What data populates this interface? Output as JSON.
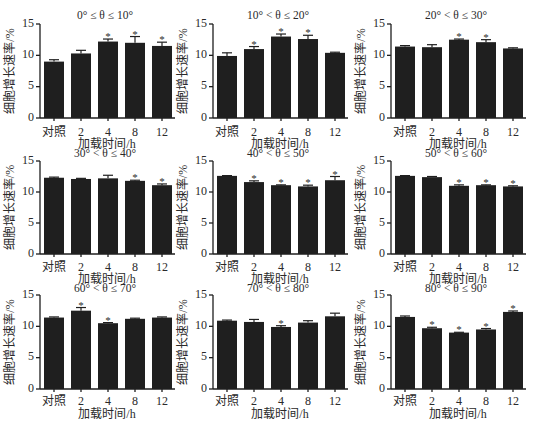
{
  "figure": {
    "layout": "3x3 grid of bar charts",
    "bar_color": "#1f1f1f",
    "axis_color": "#1e1e1e",
    "text_color": "#2a2a2a"
  },
  "chart_data": [
    {
      "type": "bar",
      "title": "0° ≤ θ ≤ 10°",
      "categories": [
        "对照",
        "2",
        "4",
        "8",
        "12"
      ],
      "values": [
        9.0,
        10.3,
        12.2,
        12.0,
        11.5
      ],
      "errors": [
        0.3,
        0.5,
        0.4,
        1.0,
        0.6
      ],
      "significant": [
        false,
        false,
        true,
        true,
        true
      ],
      "xlabel": "加载时间/h",
      "ylabel": "细胞增长速率/%",
      "yticks": [
        0,
        5,
        10,
        15
      ],
      "ylim": [
        0,
        15
      ],
      "grid": false
    },
    {
      "type": "bar",
      "title": "10° < θ ≤ 20°",
      "categories": [
        "对照",
        "2",
        "4",
        "8",
        "12"
      ],
      "values": [
        9.9,
        11.0,
        13.0,
        12.6,
        10.4
      ],
      "errors": [
        0.5,
        0.4,
        0.4,
        0.6,
        0.1
      ],
      "significant": [
        false,
        true,
        true,
        true,
        false
      ],
      "xlabel": "加载时间/h",
      "ylabel": "细胞增长速率/%",
      "yticks": [
        0,
        5,
        10,
        15
      ],
      "ylim": [
        0,
        15
      ],
      "grid": false
    },
    {
      "type": "bar",
      "title": "20° < θ ≤ 30°",
      "categories": [
        "对照",
        "2",
        "4",
        "8",
        "12"
      ],
      "values": [
        11.4,
        11.3,
        12.5,
        12.1,
        11.1
      ],
      "errors": [
        0.15,
        0.4,
        0.1,
        0.4,
        0.1
      ],
      "significant": [
        false,
        false,
        true,
        true,
        false
      ],
      "xlabel": "加载时间/h",
      "ylabel": "细胞增长速率/%",
      "yticks": [
        0,
        5,
        10,
        15
      ],
      "ylim": [
        0,
        15
      ],
      "grid": false
    },
    {
      "type": "bar",
      "title": "30° < θ ≤ 40°",
      "categories": [
        "对照",
        "2",
        "4",
        "8",
        "12"
      ],
      "values": [
        12.3,
        12.1,
        12.2,
        11.8,
        11.1
      ],
      "errors": [
        0.1,
        0.1,
        0.5,
        0.1,
        0.2
      ],
      "significant": [
        false,
        false,
        false,
        true,
        true
      ],
      "xlabel": "加载时间/h",
      "ylabel": "细胞增长速率/%",
      "yticks": [
        0,
        5,
        10,
        15
      ],
      "ylim": [
        0,
        15
      ],
      "grid": false
    },
    {
      "type": "bar",
      "title": "40° < θ ≤ 50°",
      "categories": [
        "对照",
        "2",
        "4",
        "8",
        "12"
      ],
      "values": [
        12.6,
        11.6,
        11.1,
        10.9,
        11.9
      ],
      "errors": [
        0.05,
        0.2,
        0.05,
        0.2,
        0.6
      ],
      "significant": [
        false,
        true,
        true,
        true,
        true
      ],
      "xlabel": "加载时间/h",
      "ylabel": "细胞增长速率/%",
      "yticks": [
        0,
        5,
        10,
        15
      ],
      "ylim": [
        0,
        15
      ],
      "grid": false
    },
    {
      "type": "bar",
      "title": "50° < θ ≤ 60°",
      "categories": [
        "对照",
        "2",
        "4",
        "8",
        "12"
      ],
      "values": [
        12.6,
        12.4,
        11.0,
        11.1,
        10.9
      ],
      "errors": [
        0.05,
        0.1,
        0.15,
        0.05,
        0.1
      ],
      "significant": [
        false,
        false,
        true,
        true,
        true
      ],
      "xlabel": "加载时间/h",
      "ylabel": "细胞增长速率/%",
      "yticks": [
        0,
        5,
        10,
        15
      ],
      "ylim": [
        0,
        15
      ],
      "grid": false
    },
    {
      "type": "bar",
      "title": "60° < θ ≤ 70°",
      "categories": [
        "对照",
        "2",
        "4",
        "8",
        "12"
      ],
      "values": [
        11.4,
        12.5,
        10.5,
        11.2,
        11.4
      ],
      "errors": [
        0.1,
        0.5,
        0.1,
        0.1,
        0.1
      ],
      "significant": [
        false,
        true,
        true,
        false,
        false
      ],
      "xlabel": "加载时间/h",
      "ylabel": "细胞增长速率/%",
      "yticks": [
        0,
        5,
        10,
        15
      ],
      "ylim": [
        0,
        15
      ],
      "grid": false
    },
    {
      "type": "bar",
      "title": "70° < θ ≤ 80°",
      "categories": [
        "对照",
        "2",
        "4",
        "8",
        "12"
      ],
      "values": [
        10.9,
        10.7,
        9.9,
        10.6,
        11.6
      ],
      "errors": [
        0.1,
        0.4,
        0.2,
        0.3,
        0.5
      ],
      "significant": [
        false,
        false,
        true,
        false,
        false
      ],
      "xlabel": "加载时间/h",
      "ylabel": "细胞增长速率/%",
      "yticks": [
        0,
        5,
        10,
        15
      ],
      "ylim": [
        0,
        15
      ],
      "grid": false
    },
    {
      "type": "bar",
      "title": "80° < θ ≤ 90°",
      "categories": [
        "对照",
        "2",
        "4",
        "8",
        "12"
      ],
      "values": [
        11.5,
        9.7,
        9.0,
        9.5,
        12.3
      ],
      "errors": [
        0.15,
        0.15,
        0.05,
        0.15,
        0.15
      ],
      "significant": [
        false,
        true,
        true,
        true,
        true
      ],
      "xlabel": "加载时间/h",
      "ylabel": "细胞增长速率/%",
      "yticks": [
        0,
        5,
        10,
        15
      ],
      "ylim": [
        0,
        15
      ],
      "grid": false
    }
  ]
}
